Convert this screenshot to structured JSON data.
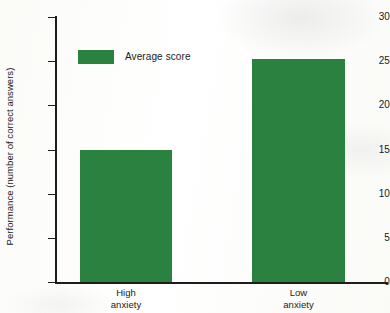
{
  "chart_data": {
    "type": "bar",
    "title": "",
    "subtitle": "",
    "xlabel": "",
    "ylabel": "Performance (number of correct answers)",
    "categories": [
      "High anxiety",
      "Low anxiety"
    ],
    "category_lines": [
      [
        "High",
        "anxiety"
      ],
      [
        "Low",
        "anxiety"
      ]
    ],
    "series": [
      {
        "name": "Average score",
        "values": [
          15,
          25.3
        ],
        "color": "#2a8140"
      }
    ],
    "ylim": [
      0,
      30
    ],
    "ytick_values": [
      0,
      5,
      10,
      15,
      20,
      25,
      30
    ],
    "ytick_labels": [
      "0",
      "5",
      "10",
      "15",
      "20",
      "25",
      "30"
    ],
    "grid": false,
    "legend": {
      "position": "upper-left-inside",
      "entries": [
        {
          "label": "Average score",
          "color": "#2a8140"
        }
      ]
    },
    "axis_color": "#1d1d1d",
    "background": "#fdfdfb"
  }
}
